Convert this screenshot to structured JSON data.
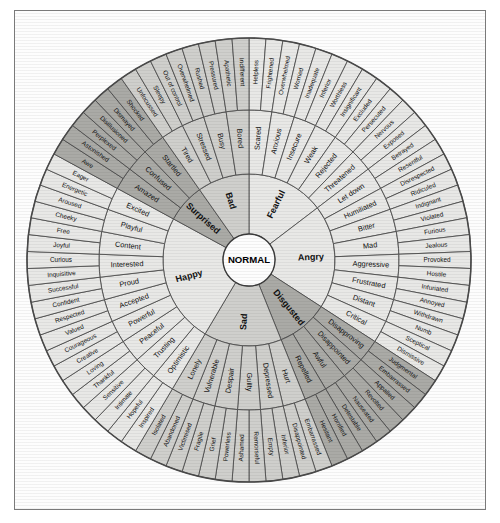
{
  "diagram": {
    "center_label": "NORMAL",
    "geometry": {
      "cx": 236,
      "cy": 250,
      "r_core": 26,
      "r_inner": 86,
      "r_mid": 150,
      "r_outer": 222,
      "start_angle_deg": -90
    },
    "colors": {
      "light": "#e8e8e6",
      "medium": "#cfcfcc",
      "dark": "#aaaaa6",
      "line": "#4a4a4a",
      "text": "#111111",
      "background": "#fdfdfd"
    },
    "sectors": [
      {
        "name": "Fearful",
        "shade": "light",
        "middle": [
          {
            "name": "Scared",
            "outer": [
              "Helpless",
              "Frightened"
            ]
          },
          {
            "name": "Anxious",
            "outer": [
              "Overwhelmed",
              "Worried"
            ]
          },
          {
            "name": "Insecure",
            "outer": [
              "Inadequate",
              "Inferior"
            ]
          },
          {
            "name": "Weak",
            "outer": [
              "Worthless",
              "Insignificant"
            ]
          },
          {
            "name": "Rejected",
            "outer": [
              "Excluded",
              "Persecuted"
            ]
          },
          {
            "name": "Threatened",
            "outer": [
              "Nervous",
              "Exposed"
            ]
          }
        ]
      },
      {
        "name": "Angry",
        "shade": "light",
        "middle": [
          {
            "name": "Let down",
            "outer": [
              "Betrayed",
              "Resentful"
            ]
          },
          {
            "name": "Humiliated",
            "outer": [
              "Disrespected",
              "Ridiculed"
            ]
          },
          {
            "name": "Bitter",
            "outer": [
              "Indignant",
              "Violated"
            ]
          },
          {
            "name": "Mad",
            "outer": [
              "Furious",
              "Jealous"
            ]
          },
          {
            "name": "Aggressive",
            "outer": [
              "Provoked",
              "Hostile"
            ]
          },
          {
            "name": "Frustrated",
            "outer": [
              "Infuriated",
              "Annoyed"
            ]
          },
          {
            "name": "Distant",
            "outer": [
              "Withdrawn",
              "Numb"
            ]
          },
          {
            "name": "Critical",
            "outer": [
              "Sceptical",
              "Dismissive"
            ]
          }
        ]
      },
      {
        "name": "Disgusted",
        "shade": "dark",
        "middle": [
          {
            "name": "Disapproving",
            "outer": [
              "Judgmental",
              "Embarrassed"
            ]
          },
          {
            "name": "Disappointed",
            "outer": [
              "Appalled",
              "Revolted"
            ]
          },
          {
            "name": "Awful",
            "outer": [
              "Nauseated",
              "Detestable"
            ]
          },
          {
            "name": "Repelled",
            "outer": [
              "Horrified",
              "Hesitant"
            ]
          }
        ]
      },
      {
        "name": "Sad",
        "shade": "medium",
        "middle": [
          {
            "name": "Hurt",
            "outer": [
              "Embarrassed",
              "Disappointed"
            ]
          },
          {
            "name": "Depressed",
            "outer": [
              "Inferior",
              "Empty"
            ]
          },
          {
            "name": "Guilty",
            "outer": [
              "Remorseful",
              "Ashamed"
            ]
          },
          {
            "name": "Despair",
            "outer": [
              "Powerless",
              "Grief"
            ]
          },
          {
            "name": "Vulnerable",
            "outer": [
              "Fragile",
              "Victimised"
            ]
          },
          {
            "name": "Lonely",
            "outer": [
              "Abandoned",
              "Isolated"
            ]
          }
        ]
      },
      {
        "name": "Happy",
        "shade": "light",
        "middle": [
          {
            "name": "Optimistic",
            "outer": [
              "Inspired",
              "Hopeful"
            ]
          },
          {
            "name": "Trusting",
            "outer": [
              "Intimate",
              "Sensitive"
            ]
          },
          {
            "name": "Peaceful",
            "outer": [
              "Thankful",
              "Loving"
            ]
          },
          {
            "name": "Powerful",
            "outer": [
              "Creative",
              "Courageous"
            ]
          },
          {
            "name": "Accepted",
            "outer": [
              "Valued",
              "Respected"
            ]
          },
          {
            "name": "Proud",
            "outer": [
              "Confident",
              "Successful"
            ]
          },
          {
            "name": "Interested",
            "outer": [
              "Inquisitive",
              "Curious"
            ]
          },
          {
            "name": "Content",
            "outer": [
              "Joyful",
              "Free"
            ]
          },
          {
            "name": "Playful",
            "outer": [
              "Cheeky",
              "Aroused"
            ]
          },
          {
            "name": "Excited",
            "outer": [
              "Energetic",
              "Eager"
            ]
          }
        ]
      },
      {
        "name": "Surprised",
        "shade": "dark",
        "middle": [
          {
            "name": "Amazed",
            "outer": [
              "Awe",
              "Astonished"
            ]
          },
          {
            "name": "Confused",
            "outer": [
              "Perplexed",
              "Disillusioned"
            ]
          },
          {
            "name": "Startled",
            "outer": [
              "Dismayed",
              "Shocked"
            ]
          }
        ]
      },
      {
        "name": "Bad",
        "shade": "medium",
        "middle": [
          {
            "name": "Tired",
            "outer": [
              "Unfocussed",
              "Sleepy"
            ]
          },
          {
            "name": "Stressed",
            "outer": [
              "Out of control",
              "Overwhelmed"
            ]
          },
          {
            "name": "Busy",
            "outer": [
              "Rushed",
              "Pressured"
            ]
          },
          {
            "name": "Bored",
            "outer": [
              "Apathetic",
              "Indifferent"
            ]
          }
        ]
      }
    ]
  }
}
